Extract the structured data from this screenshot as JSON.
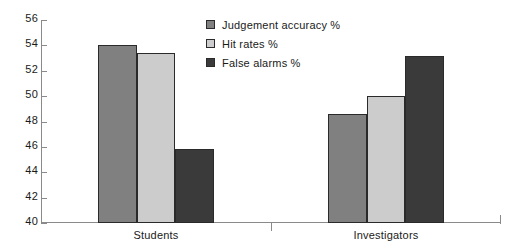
{
  "chart_data": {
    "type": "bar",
    "title": "",
    "xlabel": "",
    "ylabel": "",
    "categories": [
      "Students",
      "Investigators"
    ],
    "series": [
      {
        "name": "Judgement accuracy %",
        "values": [
          54.0,
          48.6
        ],
        "color": "#808080"
      },
      {
        "name": "Hit rates %",
        "values": [
          53.4,
          50.0
        ],
        "color": "#cccccc"
      },
      {
        "name": "False alarms %",
        "values": [
          45.8,
          53.2
        ],
        "color": "#3a3a3a"
      }
    ],
    "ylim": [
      40,
      56
    ],
    "yticks": [
      40,
      42,
      44,
      46,
      48,
      50,
      52,
      54,
      56
    ],
    "grid": false,
    "legend_position": "top-center"
  },
  "legend": {
    "items": [
      {
        "label": "Judgement accuracy %"
      },
      {
        "label": "Hit rates %"
      },
      {
        "label": "False alarms %"
      }
    ]
  }
}
